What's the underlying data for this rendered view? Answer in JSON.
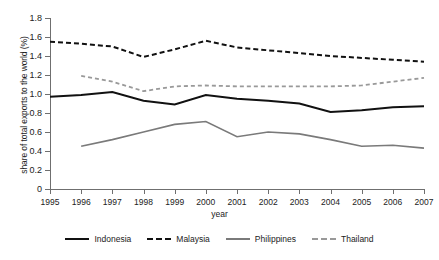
{
  "chart_data": {
    "type": "line",
    "title": "",
    "xlabel": "year",
    "ylabel": "share of total exports to the world (%)",
    "x": [
      1995,
      1996,
      1997,
      1998,
      1999,
      2000,
      2001,
      2002,
      2003,
      2004,
      2005,
      2006,
      2007
    ],
    "xtick_labels": [
      "1995",
      "1996",
      "1997",
      "1998",
      "1999",
      "2000",
      "2001",
      "2002",
      "2003",
      "2004",
      "2005",
      "2006",
      "2007"
    ],
    "ytick_labels": [
      "0",
      "0.2",
      "0.4",
      "0.6",
      "0.8",
      "1.0",
      "1.2",
      "1.4",
      "1.6",
      "1.8"
    ],
    "ytick_values": [
      0,
      0.2,
      0.4,
      0.6,
      0.8,
      1.0,
      1.2,
      1.4,
      1.6,
      1.8
    ],
    "ylim": [
      0,
      1.8
    ],
    "xlim": [
      1995,
      2007
    ],
    "grid": false,
    "legend_position": "bottom",
    "series": [
      {
        "name": "Indonesia",
        "color": "#111111",
        "style": "solid",
        "width": 2.0,
        "values": [
          0.97,
          0.99,
          1.02,
          0.93,
          0.89,
          0.99,
          0.95,
          0.93,
          0.9,
          0.81,
          0.83,
          0.86,
          0.87
        ]
      },
      {
        "name": "Malaysia",
        "color": "#111111",
        "style": "dashed",
        "width": 2.0,
        "values": [
          1.55,
          1.53,
          1.5,
          1.39,
          1.47,
          1.56,
          1.49,
          1.46,
          1.43,
          1.4,
          1.38,
          1.36,
          1.34
        ]
      },
      {
        "name": "Philippines",
        "color": "#7a7a7a",
        "style": "solid",
        "width": 1.6,
        "values": [
          null,
          0.45,
          0.52,
          0.6,
          0.68,
          0.71,
          0.55,
          0.6,
          0.58,
          0.52,
          0.45,
          0.46,
          0.43
        ]
      },
      {
        "name": "Thailand",
        "color": "#999999",
        "style": "dashed",
        "width": 1.8,
        "values": [
          null,
          1.19,
          1.13,
          1.03,
          1.08,
          1.09,
          1.08,
          1.08,
          1.08,
          1.08,
          1.09,
          1.13,
          1.17
        ]
      }
    ]
  }
}
